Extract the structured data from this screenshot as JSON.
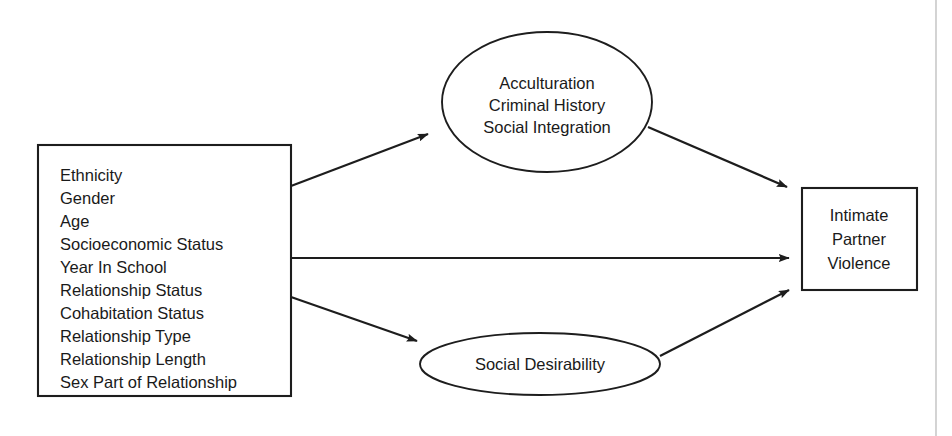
{
  "diagram": {
    "type": "path-model",
    "background_color": "#ffffff",
    "line_color": "#1d1d1d",
    "text_color": "#1a1a1a",
    "nodes": {
      "predictors": {
        "shape": "rectangle",
        "items": [
          "Ethnicity",
          "Gender",
          "Age",
          "Socioeconomic Status",
          "Year In School",
          "Relationship Status",
          "Cohabitation Status",
          "Relationship Type",
          "Relationship Length",
          "Sex Part of Relationship"
        ]
      },
      "mediator_top": {
        "shape": "ellipse",
        "items": [
          "Acculturation",
          "Criminal History",
          "Social Integration"
        ]
      },
      "mediator_bottom": {
        "shape": "ellipse",
        "items": [
          "Social Desirability"
        ]
      },
      "outcome": {
        "shape": "rectangle",
        "items": [
          "Intimate",
          "Partner",
          "Violence"
        ]
      }
    },
    "edges": [
      {
        "id": "predictors-to-top-mediator",
        "from": "predictors",
        "to": "mediator_top",
        "style": "solid-arrow"
      },
      {
        "id": "predictors-to-outcome",
        "from": "predictors",
        "to": "outcome",
        "style": "solid-arrow"
      },
      {
        "id": "predictors-to-bottom-mediator",
        "from": "predictors",
        "to": "mediator_bottom",
        "style": "solid-arrow"
      },
      {
        "id": "top-mediator-to-outcome",
        "from": "mediator_top",
        "to": "outcome",
        "style": "solid-arrow"
      },
      {
        "id": "bottom-mediator-to-outcome",
        "from": "mediator_bottom",
        "to": "outcome",
        "style": "solid-arrow"
      }
    ]
  }
}
